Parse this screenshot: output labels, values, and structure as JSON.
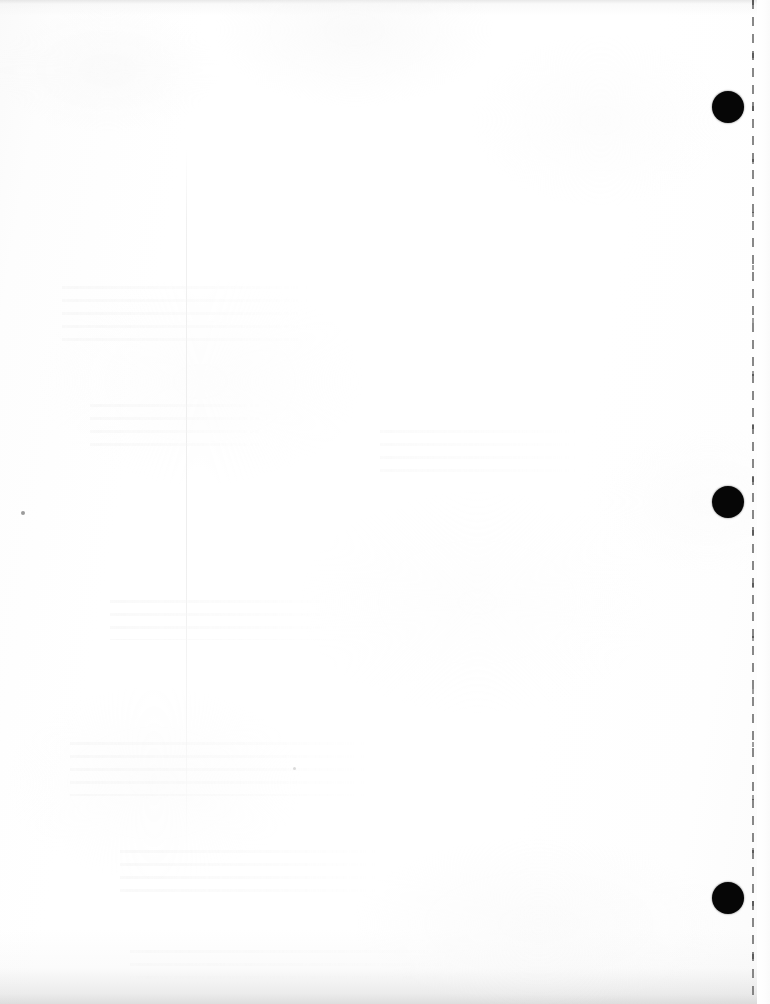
{
  "page": {
    "kind": "scanned-blank-page",
    "width": 770,
    "height": 1004,
    "background_color": "#ffffff",
    "paper_tone_color": "#fafafa"
  },
  "perforation": {
    "name": "dashed-tear-line",
    "color": "#6e6e6e",
    "x": 753,
    "top": 0,
    "bottom": 998,
    "dash_length": 9,
    "gap_length": 8,
    "thickness": 2
  },
  "punch_marks": {
    "color": "#060606",
    "diameter": 32,
    "center_x": 728,
    "items": [
      {
        "label": "punch-mark-top",
        "center_y": 107
      },
      {
        "label": "punch-mark-middle",
        "center_y": 502
      },
      {
        "label": "punch-mark-bottom",
        "center_y": 898
      }
    ]
  },
  "artifacts": {
    "crease_line": {
      "label": "vertical-fold-crease",
      "x": 186,
      "top": 150,
      "height": 700,
      "color": "#ededed"
    },
    "ghost_text_blocks": [
      {
        "label": "bleed-through-upper-left",
        "x": 62,
        "y": 286,
        "width": 250,
        "height": 62
      },
      {
        "label": "bleed-through-mid-left",
        "x": 90,
        "y": 404,
        "width": 180,
        "height": 48
      },
      {
        "label": "bleed-through-center-left",
        "x": 110,
        "y": 600,
        "width": 230,
        "height": 40
      },
      {
        "label": "bleed-through-lower-left",
        "x": 70,
        "y": 742,
        "width": 300,
        "height": 54
      },
      {
        "label": "bleed-through-lower-mid",
        "x": 120,
        "y": 850,
        "width": 260,
        "height": 44
      },
      {
        "label": "bleed-through-center",
        "x": 380,
        "y": 430,
        "width": 200,
        "height": 52
      },
      {
        "label": "bleed-through-bottom",
        "x": 130,
        "y": 950,
        "width": 330,
        "height": 32
      }
    ],
    "specks": [
      {
        "label": "dust-speck-left",
        "x": 21,
        "y": 511,
        "size": 4,
        "color": "#9b9b9b"
      },
      {
        "label": "dust-speck-mid",
        "x": 293,
        "y": 767,
        "size": 3,
        "color": "#dadada"
      }
    ],
    "edge_shading": {
      "top_band_color": "#c4c4c4",
      "bottom_band_color": "#bcbcbc"
    }
  }
}
